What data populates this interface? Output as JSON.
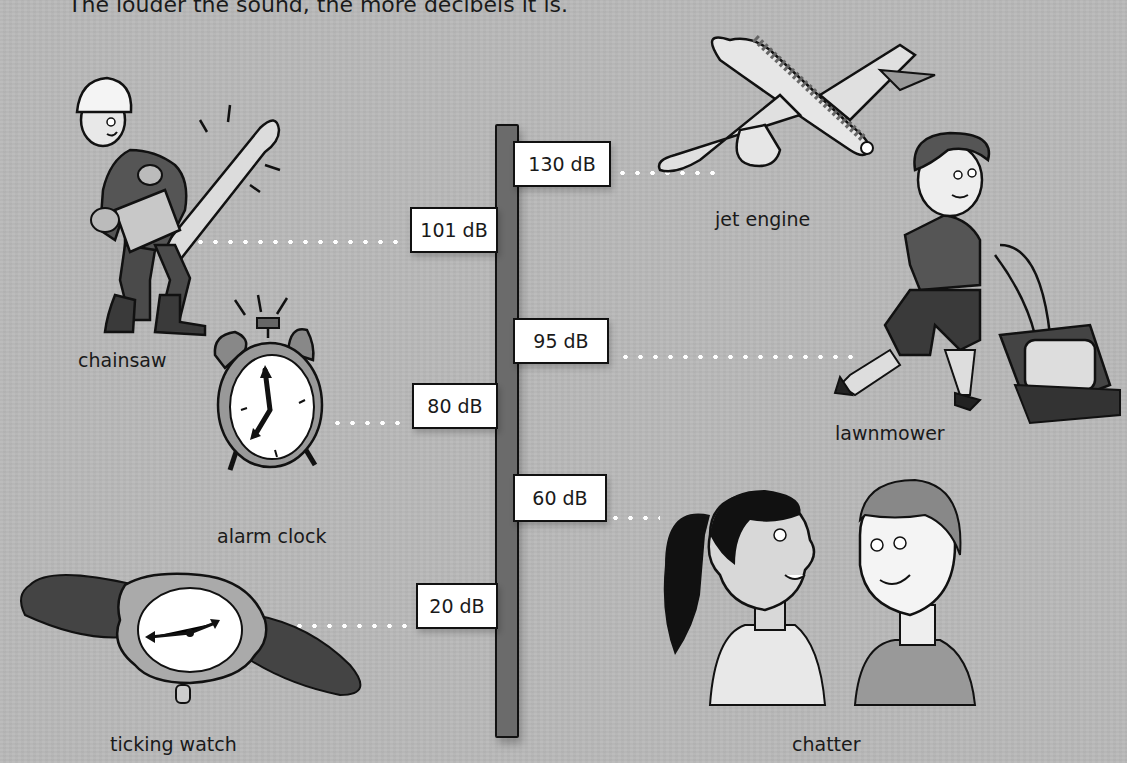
{
  "intro_text": "The louder the sound, the more decibels it is.",
  "colors": {
    "background": "#b9b9b9",
    "pole": "#6b6b6b",
    "sign_fill": "#ffffff",
    "outline": "#111111",
    "connector_dots": "#ffffff"
  },
  "scale_signs": [
    {
      "value": "130 dB",
      "side": "right",
      "source": "jet engine"
    },
    {
      "value": "101 dB",
      "side": "left",
      "source": "chainsaw"
    },
    {
      "value": "95 dB",
      "side": "right",
      "source": "lawnmower"
    },
    {
      "value": "80 dB",
      "side": "left",
      "source": "alarm clock"
    },
    {
      "value": "60 dB",
      "side": "right",
      "source": "chatter"
    },
    {
      "value": "20 dB",
      "side": "left",
      "source": "ticking watch"
    }
  ],
  "items": {
    "chainsaw": {
      "label": "chainsaw"
    },
    "alarm_clock": {
      "label": "alarm clock"
    },
    "ticking_watch": {
      "label": "ticking watch"
    },
    "jet_engine": {
      "label": "jet engine"
    },
    "lawnmower": {
      "label": "lawnmower"
    },
    "chatter": {
      "label": "chatter"
    }
  }
}
